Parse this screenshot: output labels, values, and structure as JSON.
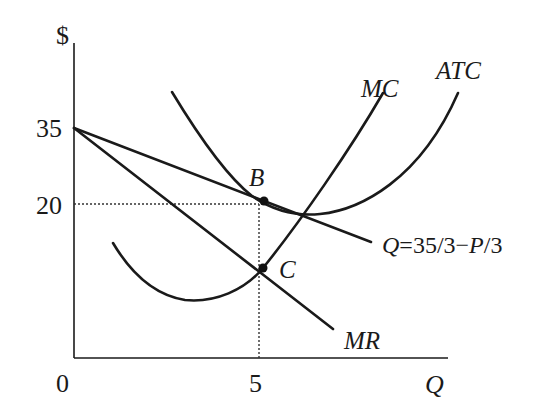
{
  "chart_data": {
    "type": "line",
    "title": "",
    "xlabel": "Q",
    "ylabel": "$",
    "x_ticks": [
      "0",
      "5"
    ],
    "y_ticks": [
      "35",
      "20"
    ],
    "curves": [
      {
        "name": "Demand",
        "label": "Q=35/3−P/3",
        "kind": "line",
        "points": [
          [
            0,
            35
          ],
          [
            5,
            20
          ]
        ]
      },
      {
        "name": "MR",
        "label": "MR",
        "kind": "line",
        "points": [
          [
            0,
            35
          ],
          [
            5,
            5
          ]
        ]
      },
      {
        "name": "MC",
        "label": "MC",
        "kind": "curve"
      },
      {
        "name": "ATC",
        "label": "ATC",
        "kind": "curve"
      }
    ],
    "points": [
      {
        "name": "B",
        "label": "B",
        "x": 5,
        "y": 20
      },
      {
        "name": "C",
        "label": "C",
        "x": 5,
        "y": 5
      }
    ],
    "guides": [
      {
        "from": [
          0,
          20
        ],
        "to": [
          5,
          20
        ]
      },
      {
        "from": [
          5,
          0
        ],
        "to": [
          5,
          20
        ]
      }
    ],
    "grid": false,
    "legend": "none"
  }
}
